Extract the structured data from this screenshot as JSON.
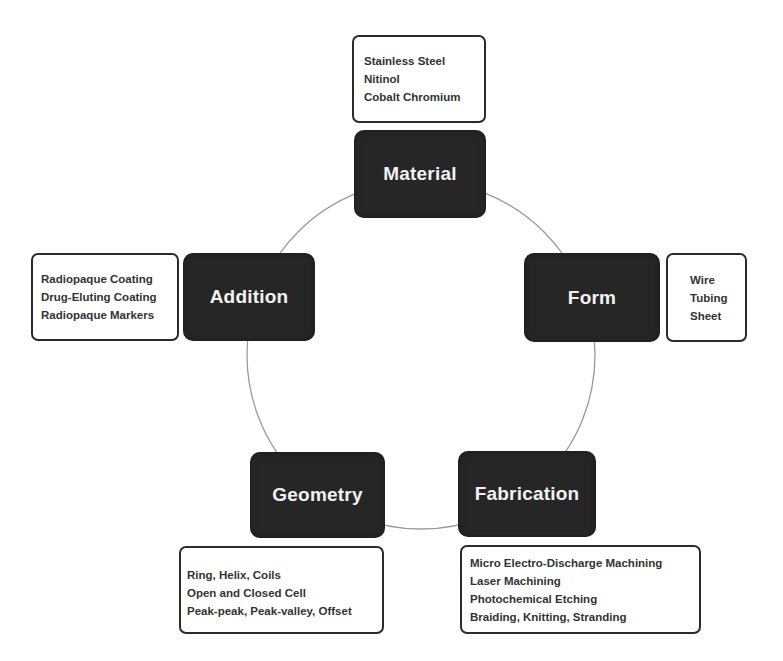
{
  "diagram": {
    "type": "cycle",
    "colors": {
      "node_fill": "#262626",
      "node_text": "#f2f2f2",
      "detail_border": "#2b2b2b",
      "detail_text": "#333333",
      "ring_stroke": "#9a9a9a",
      "background": "#ffffff"
    },
    "nodes": {
      "material": {
        "label": "Material",
        "details": [
          "Stainless Steel",
          "Nitinol",
          "Cobalt Chromium"
        ]
      },
      "form": {
        "label": "Form",
        "details": [
          "Wire",
          "Tubing",
          "Sheet"
        ]
      },
      "fabrication": {
        "label": "Fabrication",
        "details": [
          "Micro Electro-Discharge Machining",
          "Laser Machining",
          "Photochemical Etching",
          "Braiding, Knitting, Stranding"
        ]
      },
      "geometry": {
        "label": "Geometry",
        "details": [
          "Ring, Helix, Coils",
          "Open and Closed Cell",
          "Peak-peak, Peak-valley, Offset"
        ]
      },
      "addition": {
        "label": "Addition",
        "details": [
          "Radiopaque Coating",
          "Drug-Eluting Coating",
          "Radiopaque Markers"
        ]
      }
    },
    "cycle_order": [
      "Material",
      "Form",
      "Fabrication",
      "Geometry",
      "Addition"
    ]
  }
}
